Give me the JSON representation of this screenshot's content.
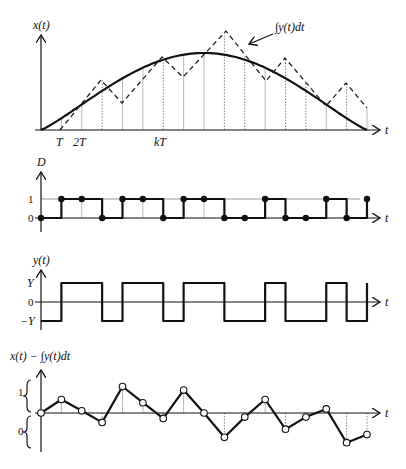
{
  "panels": {
    "top": {
      "y_label": "x(t)",
      "x_label": "t",
      "tick_labels": [
        "T",
        "2T",
        "kT"
      ],
      "annotation": "∫y(t)dt"
    },
    "d": {
      "y_label": "D",
      "x_label": "t",
      "level_labels": [
        "1",
        "0"
      ]
    },
    "y": {
      "y_label": "y(t)",
      "x_label": "t",
      "level_labels": [
        "Y",
        "0",
        "−Y"
      ]
    },
    "err": {
      "y_label": "x(t) − ∫y(t)dt",
      "x_label": "t",
      "region_labels": [
        "1",
        "0"
      ]
    }
  },
  "chart_data": [
    {
      "type": "line",
      "title": "x(t) and ∫y(t)dt",
      "xlabel": "t",
      "ylabel": "x(t)",
      "x_ticks": [
        "T",
        "2T",
        "kT"
      ],
      "sample_index": [
        0,
        1,
        2,
        3,
        4,
        5,
        6,
        7,
        8,
        9,
        10,
        11,
        12,
        13,
        14,
        15,
        16
      ],
      "series": [
        {
          "name": "x(t)",
          "style": "solid",
          "description": "smooth half-sine rising from 0 at t=0, peaking near sample 8, returning to 0 at sample 16"
        },
        {
          "name": "∫y(t)dt",
          "style": "dashed",
          "vertices": [
            [
              1,
              0
            ],
            [
              3,
              0.6
            ],
            [
              4,
              0.33
            ],
            [
              6,
              0.88
            ],
            [
              7,
              0.64
            ],
            [
              9,
              1.19
            ],
            [
              11,
              0.59
            ],
            [
              12,
              0.86
            ],
            [
              14,
              0.29
            ],
            [
              15,
              0.56
            ],
            [
              16,
              0.26
            ]
          ]
        }
      ]
    },
    {
      "type": "line",
      "title": "D",
      "xlabel": "t",
      "ylabel": "D",
      "yticks": [
        0,
        1
      ],
      "samples": [
        0,
        1,
        1,
        0,
        1,
        1,
        0,
        1,
        1,
        0,
        0,
        1,
        0,
        0,
        1,
        0,
        1
      ]
    },
    {
      "type": "line",
      "title": "y(t)",
      "xlabel": "t",
      "ylabel": "y(t)",
      "yticks": [
        "-Y",
        "0",
        "Y"
      ],
      "levels": [
        -1,
        1,
        1,
        -1,
        1,
        1,
        -1,
        1,
        1,
        -1,
        -1,
        1,
        -1,
        -1,
        1,
        -1,
        1
      ]
    },
    {
      "type": "line",
      "title": "x(t) − ∫y(t)dt",
      "xlabel": "t",
      "ylabel": "x(t) − ∫y(t)dt",
      "regions": [
        "1 (above zero)",
        "0 (below zero)"
      ],
      "values": [
        0,
        0.5,
        0.08,
        -0.35,
        0.98,
        0.38,
        -0.2,
        0.85,
        0,
        -0.9,
        -0.15,
        0.5,
        -0.6,
        -0.15,
        0.15,
        -1.1,
        -0.8
      ]
    }
  ]
}
